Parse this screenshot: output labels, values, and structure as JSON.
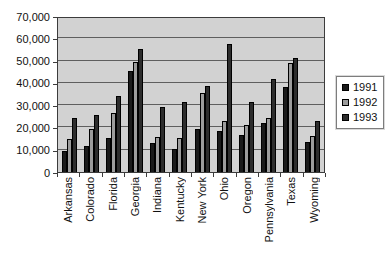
{
  "chart_data": {
    "type": "bar",
    "title": "",
    "xlabel": "",
    "ylabel": "",
    "categories": [
      "Arkansas",
      "Colorado",
      "Florida",
      "Georgia",
      "Indiana",
      "Kentucky",
      "New York",
      "Ohio",
      "Oregon",
      "Pennsylvania",
      "Texas",
      "Wyoming"
    ],
    "series": [
      {
        "name": "1991",
        "color": "#1a1a1a",
        "values": [
          9500,
          12000,
          15500,
          46000,
          13000,
          10500,
          19500,
          18500,
          17000,
          22500,
          38500,
          13500
        ]
      },
      {
        "name": "1992",
        "color": "#9c9c9c",
        "values": [
          15000,
          19500,
          27000,
          50000,
          16000,
          15500,
          36000,
          23000,
          21500,
          24500,
          49500,
          16500
        ]
      },
      {
        "name": "1993",
        "color": "#2d2d2d",
        "values": [
          24500,
          26000,
          34500,
          56000,
          29500,
          32000,
          39000,
          58000,
          32000,
          42500,
          52000,
          23000
        ]
      }
    ],
    "ylim": [
      0,
      70000
    ],
    "ytick_interval": 10000,
    "ytick_labels_top_down": [
      "70,000",
      "60,000",
      "50,000",
      "40,000",
      "30,000",
      "20,000",
      "10,000",
      "0"
    ],
    "grid": true,
    "legend_position": "right",
    "legend_entries": [
      "1991",
      "1992",
      "1993"
    ],
    "plot_background": "#d2d2d2",
    "gridline_color": "#5f5f5f"
  }
}
